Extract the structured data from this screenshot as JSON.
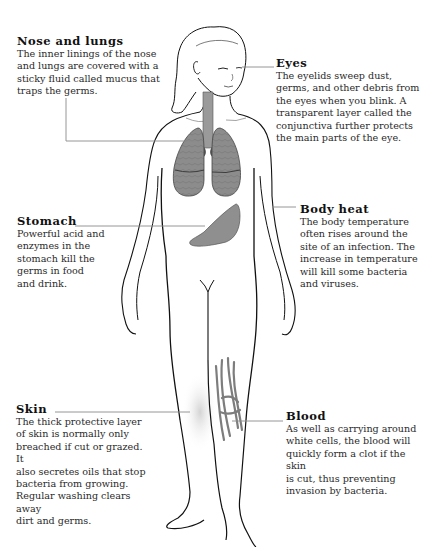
{
  "diagram": {
    "colors": {
      "text": "#1a1a1a",
      "leader_line": "#8a8a8a",
      "outline": "#111111",
      "organ_fill": "#8f8f8f",
      "skin_shade": "#d9d9d9"
    },
    "callouts": {
      "nose": {
        "title": "Nose and lungs",
        "body": "The inner linings of the nose\nand lungs are covered with a\nsticky fluid called mucus that\ntraps the germs."
      },
      "eyes": {
        "title": "Eyes",
        "body": "The eyelids sweep dust,\ngerms, and other debris from\nthe eyes when you blink. A\ntransparent layer called the\nconjunctiva further protects\n the main parts of the eye."
      },
      "stomach": {
        "title": "Stomach",
        "body": "Powerful acid and\nenzymes in the\nstomach kill the\ngerms in food\nand drink."
      },
      "heat": {
        "title": "Body heat",
        "body": "The body temperature\noften rises around the\nsite of an infection. The\nincrease in temperature\nwill kill some bacteria\nand viruses."
      },
      "skin": {
        "title": "Skin",
        "body": "The thick protective layer\nof skin is normally only\nbreached if cut or grazed. It\nalso secretes oils that stop\nbacteria from growing.\nRegular washing clears away\ndirt and germs."
      },
      "blood": {
        "title": "Blood",
        "body": "As well as carrying around\nwhite cells, the blood will\nquickly form a clot if the skin\nis cut, thus preventing\ninvasion by bacteria."
      }
    }
  }
}
